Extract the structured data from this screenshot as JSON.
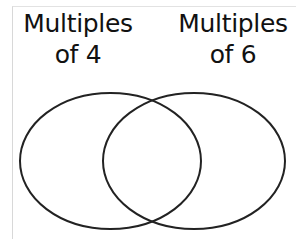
{
  "diagram": {
    "type": "venn",
    "sets": [
      {
        "label_line1": "Multiples",
        "label_line2": "of 4"
      },
      {
        "label_line1": "Multiples",
        "label_line2": "of 6"
      }
    ],
    "stroke_color": "#222222",
    "background": "#ffffff"
  }
}
